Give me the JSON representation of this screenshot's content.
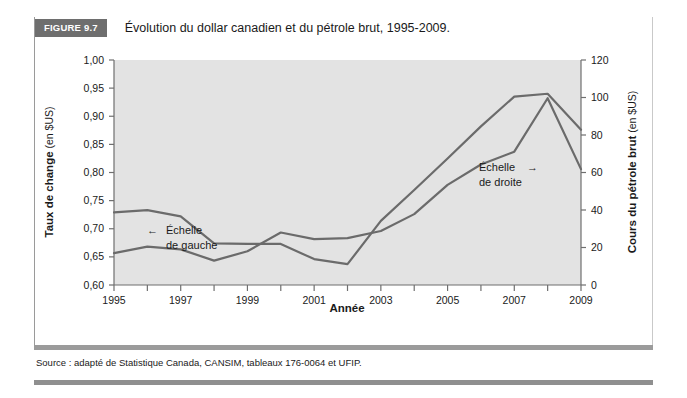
{
  "figure": {
    "tag": "FIGURE 9.7",
    "title": "Évolution du dollar canadien et du pétrole brut, 1995-2009.",
    "source": "Source : adapté de Statistique Canada, CANSIM, tableaux 176-0064 et UFIP."
  },
  "annotations": {
    "left_scale_line1": "Échelle",
    "left_scale_line2": "de gauche",
    "left_scale_arrow": "←",
    "right_scale_line1": "Échelle",
    "right_scale_line2": "de droite",
    "right_scale_arrow": "→"
  },
  "chart_data": {
    "type": "line",
    "title": "Évolution du dollar canadien et du pétrole brut, 1995-2009.",
    "xlabel": "Année",
    "ylabel": "Taux de change (en $US)",
    "ylabel_bold": "Taux de change",
    "ylabel_plain": " (en $US)",
    "y2label": "Cours du pétrole brut (en $US)",
    "y2label_bold": "Cours du pétrole brut",
    "y2label_plain": " (en $US)",
    "grid": false,
    "legend_position": "inline-annotations",
    "plot_background": "#e3e3e3",
    "line_color": "#6b6b6b",
    "x": [
      1995,
      1996,
      1997,
      1998,
      1999,
      2000,
      2001,
      2002,
      2003,
      2004,
      2005,
      2006,
      2007,
      2008,
      2009
    ],
    "xlim": [
      1995,
      2009
    ],
    "xticks": [
      1995,
      1996,
      1997,
      1998,
      1999,
      2000,
      2001,
      2002,
      2003,
      2004,
      2005,
      2006,
      2007,
      2008,
      2009
    ],
    "xtick_labels": [
      "1995",
      "",
      "1997",
      "",
      "1999",
      "",
      "2001",
      "",
      "2003",
      "",
      "2005",
      "",
      "2007",
      "",
      "2009"
    ],
    "ylim": [
      0.6,
      1.0
    ],
    "yticks": [
      0.6,
      0.65,
      0.7,
      0.75,
      0.8,
      0.85,
      0.9,
      0.95,
      1.0
    ],
    "ytick_labels": [
      "0,60",
      "0,65",
      "0,70",
      "0,75",
      "0,80",
      "0,85",
      "0,90",
      "0,95",
      "1,00"
    ],
    "y2lim": [
      0,
      120
    ],
    "y2ticks": [
      0,
      20,
      40,
      60,
      80,
      100,
      120
    ],
    "y2tick_labels": [
      "0",
      "20",
      "40",
      "60",
      "80",
      "100",
      "120"
    ],
    "series": [
      {
        "name": "Taux de change (dollar canadien)",
        "axis": "left",
        "annotation": "Échelle de gauche",
        "values": [
          0.729,
          0.733,
          0.722,
          0.674,
          0.673,
          0.673,
          0.646,
          0.637,
          0.714,
          0.769,
          0.825,
          0.882,
          0.935,
          0.94,
          0.876
        ]
      },
      {
        "name": "Cours du pétrole brut",
        "axis": "right",
        "annotation": "Échelle de droite",
        "values": [
          17.0,
          20.5,
          19.0,
          13.0,
          18.0,
          28.0,
          24.5,
          25.0,
          28.8,
          37.8,
          53.4,
          64.3,
          71.1,
          99.6,
          61.8
        ]
      }
    ]
  }
}
